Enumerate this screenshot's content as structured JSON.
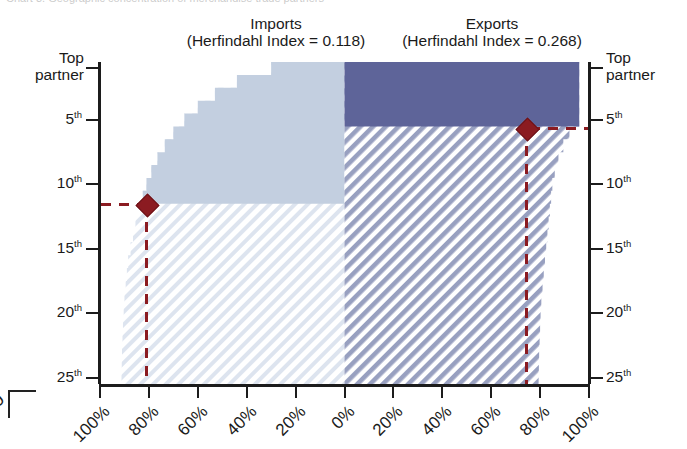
{
  "top_clipped_text": "Chart 3. Geographic concentration of merchandise trade partners",
  "bottom_left_clipped_label": "0",
  "panels": {
    "left": {
      "title": "Imports",
      "subtitle": "(Herfindahl Index = 0.118)",
      "herfindahl_index": 0.118,
      "fill_color": "#c3cfe0",
      "hatch_color": "#dbe3ee"
    },
    "right": {
      "title": "Exports",
      "subtitle": "(Herfindahl Index = 0.268)",
      "herfindahl_index": 0.268,
      "fill_color": "#5e6499",
      "hatch_color": "#9ea6c4"
    }
  },
  "y_axis": {
    "labels_left": [
      "Top partner",
      "5",
      "10",
      "15",
      "20",
      "25"
    ],
    "labels_right": [
      "Top partner",
      "5",
      "10",
      "15",
      "20",
      "25"
    ],
    "suffix": "th",
    "ranks": [
      1,
      5,
      10,
      15,
      20,
      25
    ]
  },
  "x_axis": {
    "left_labels": [
      "100%",
      "80%",
      "60%",
      "40%",
      "20%",
      "0%"
    ],
    "right_labels": [
      "0%",
      "20%",
      "40%",
      "60%",
      "80%",
      "100%"
    ]
  },
  "markers": {
    "left": {
      "rank_label": "11th",
      "share_label": "80%",
      "color": "#8b1b21"
    },
    "right": {
      "rank_label": "5th",
      "share_label": "80%",
      "color": "#8b1b21"
    }
  },
  "chart_data": {
    "type": "area",
    "title": "Geographic concentration of merchandise trade partners",
    "subtitle": "Cumulative share of trade by partner rank",
    "xlabel": "Cumulative share of trade (%)",
    "ylabel": "Partner rank",
    "grid": false,
    "legend": "none",
    "xlim": [
      0,
      100
    ],
    "ylim": [
      1,
      25
    ],
    "orientation": "mirrored-horizontal",
    "categories": [
      "Top partner",
      "2nd",
      "3rd",
      "4th",
      "5th",
      "6th",
      "7th",
      "8th",
      "9th",
      "10th",
      "11th",
      "12th",
      "13th",
      "14th",
      "15th",
      "16th",
      "17th",
      "18th",
      "19th",
      "20th",
      "21st",
      "22nd",
      "23rd",
      "24th",
      "25th"
    ],
    "series": [
      {
        "name": "Imports",
        "direction": "left",
        "herfindahl_index": 0.118,
        "color": "#c3cfe0",
        "cumulative_share": [
          30,
          44,
          53,
          60,
          65.5,
          70,
          73.5,
          76.5,
          79,
          81,
          82.5,
          84,
          85.5,
          86.5,
          87.5,
          88.5,
          89,
          89.5,
          90,
          90.3,
          90.6,
          90.8,
          91,
          91.1,
          91.2
        ],
        "marker": {
          "rank": 11,
          "share": 80
        }
      },
      {
        "name": "Exports",
        "direction": "right",
        "herfindahl_index": 0.268,
        "color": "#5e6499",
        "cumulative_share": [
          96,
          96,
          96,
          96,
          96,
          92,
          89.5,
          87.5,
          86,
          85,
          84.5,
          84,
          83.5,
          83,
          82.5,
          82,
          81.5,
          81,
          80.5,
          80.2,
          80,
          79.8,
          79.6,
          79.5,
          79.4
        ],
        "marker": {
          "rank": 5,
          "share": 80
        }
      }
    ]
  }
}
